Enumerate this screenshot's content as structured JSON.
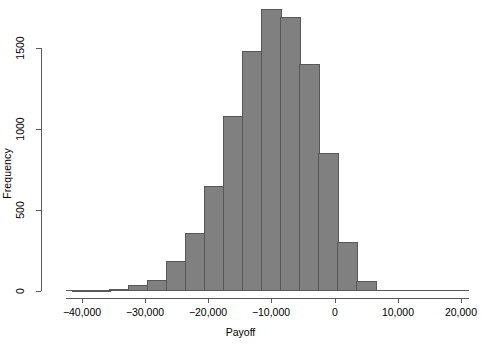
{
  "chart_data": {
    "type": "bar",
    "title": "",
    "subtitle": "",
    "xlabel": "Payoff",
    "ylabel": "Frequency",
    "grid": false,
    "legend": null,
    "xlim": [
      -42500,
      21000
    ],
    "ylim": [
      0,
      1800
    ],
    "x_tick_labels": [
      "−40,000",
      "−30,000",
      "−20,000",
      "−10,000",
      "0",
      "10,000",
      "20,000"
    ],
    "x_tick_values": [
      -40000,
      -30000,
      -20000,
      -10000,
      0,
      10000,
      20000
    ],
    "y_tick_labels": [
      "0",
      "500",
      "1000",
      "1500"
    ],
    "y_tick_values": [
      0,
      500,
      1000,
      1500
    ],
    "bin_width": 2500,
    "categories": [
      "-41,250",
      "-38,750",
      "-36,250",
      "-33,750",
      "-31,250",
      "-28,750",
      "-26,250",
      "-23,750",
      "-21,250",
      "-18,750",
      "-16,250",
      "-13,750",
      "-11,250",
      "-8,750",
      "-6,250",
      "-3,750",
      "-1,250",
      "1,250",
      "3,750",
      "6,250",
      "8,750",
      "11,250",
      "13,750",
      "16,250",
      "18,750"
    ],
    "bin_centers": [
      -41250,
      -38750,
      -36250,
      -33750,
      -31250,
      -28750,
      -26250,
      -23750,
      -21250,
      -18750,
      -16250,
      -13750,
      -11250,
      -8750,
      -6250,
      -3750,
      -1250,
      1250,
      3750,
      6250,
      8750,
      11250,
      13750,
      16250,
      18750
    ],
    "values": [
      3,
      5,
      10,
      12,
      35,
      65,
      70,
      185,
      360,
      300,
      650,
      1080,
      1480,
      1740,
      1690,
      1400,
      850,
      300,
      60,
      0,
      0,
      0,
      0,
      0,
      0
    ],
    "bars": [
      {
        "center": -40000,
        "value": 4
      },
      {
        "center": -37000,
        "value": 8
      },
      {
        "center": -34000,
        "value": 10
      },
      {
        "center": -31000,
        "value": 35
      },
      {
        "center": -28000,
        "value": 68
      },
      {
        "center": -25000,
        "value": 185
      },
      {
        "center": -22000,
        "value": 360
      },
      {
        "center": -19000,
        "value": 650
      },
      {
        "center": -16000,
        "value": 1080
      },
      {
        "center": -13000,
        "value": 1480
      },
      {
        "center": -10000,
        "value": 1740
      },
      {
        "center": -7000,
        "value": 1690
      },
      {
        "center": -4000,
        "value": 1400
      },
      {
        "center": -1000,
        "value": 850
      },
      {
        "center": 2000,
        "value": 300
      },
      {
        "center": 5000,
        "value": 60
      }
    ]
  },
  "axes": {
    "x_label": "Payoff",
    "y_label": "Frequency",
    "x_ticks": [
      {
        "label": "−40,000",
        "px": 82
      },
      {
        "label": "−30,000",
        "px": 145
      },
      {
        "label": "−20,000",
        "px": 208
      },
      {
        "label": "−10,000",
        "px": 271
      },
      {
        "label": "0",
        "px": 335
      },
      {
        "label": "10,000",
        "px": 398
      },
      {
        "label": "20,000",
        "px": 461
      }
    ],
    "y_ticks": [
      {
        "label": "0",
        "px": 291
      },
      {
        "label": "500",
        "px": 210
      },
      {
        "label": "1000",
        "px": 129
      },
      {
        "label": "1500",
        "px": 48
      }
    ]
  },
  "style": {
    "bar_fill": "#808080",
    "bar_stroke": "#575757",
    "axis_color": "#5a5a5a",
    "text_color": "#000000",
    "background": "#ffffff"
  },
  "bar_pixels": [
    {
      "left": 78,
      "top": 288,
      "width": 21,
      "height": 2
    },
    {
      "left": 109,
      "top": 287,
      "width": 21,
      "height": 3
    },
    {
      "left": 140,
      "top": 285,
      "width": 21,
      "height": 5
    },
    {
      "left": 171,
      "top": 279,
      "width": 21,
      "height": 11
    },
    {
      "left": 202,
      "top": 272,
      "width": 21,
      "height": 18
    },
    {
      "left": 233,
      "top": 260,
      "width": 21,
      "height": 30
    },
    {
      "left": 264,
      "top": 232,
      "width": 21,
      "height": 58
    },
    {
      "left": 295,
      "top": 185,
      "width": 21,
      "height": 105
    },
    {
      "left": 326,
      "top": 116,
      "width": 21,
      "height": 174
    },
    {
      "left": 357,
      "top": 51,
      "width": 21,
      "height": 239
    },
    {
      "left": 388,
      "top": 9,
      "width": 21,
      "height": 281
    },
    {
      "left": 419,
      "top": 18,
      "width": 21,
      "height": 272
    }
  ]
}
